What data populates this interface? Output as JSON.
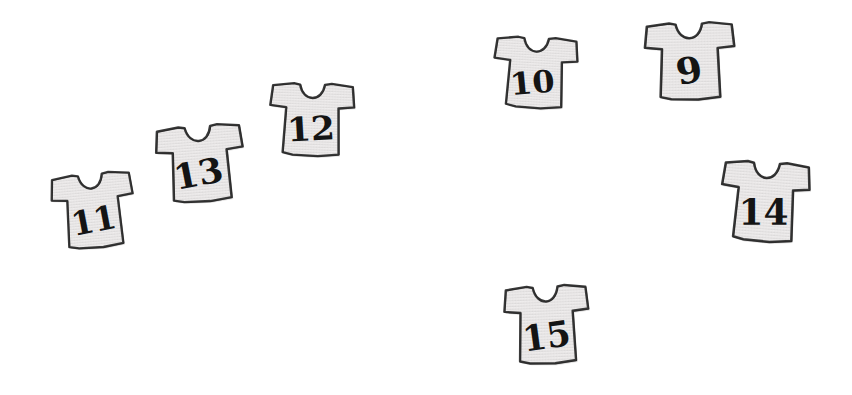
{
  "scene": {
    "width": 852,
    "height": 395,
    "background_color": "#ffffff",
    "description": "Seven hand-drawn t-shirt sketches each labelled with a number"
  },
  "style": {
    "shirt_fill": "#eceaea",
    "shirt_fill_shadow": "#dbd9d9",
    "shirt_outline": "#3a3a3a",
    "number_color": "#141414"
  },
  "shirts": [
    {
      "id": "shirt-11",
      "number": "11",
      "x": 48,
      "y": 168,
      "width": 90,
      "height": 84,
      "rotation": -5,
      "number_size": 36,
      "number_dx": 0,
      "number_dy": 10,
      "number_skew": -6
    },
    {
      "id": "shirt-13",
      "number": "13",
      "x": 152,
      "y": 120,
      "width": 96,
      "height": 86,
      "rotation": -4,
      "number_size": 37,
      "number_dx": -2,
      "number_dy": 10,
      "number_skew": -7
    },
    {
      "id": "shirt-12",
      "number": "12",
      "x": 265,
      "y": 78,
      "width": 93,
      "height": 82,
      "rotation": 2,
      "number_size": 37,
      "number_dx": 0,
      "number_dy": 10,
      "number_skew": -5
    },
    {
      "id": "shirt-10",
      "number": "10",
      "x": 489,
      "y": 32,
      "width": 92,
      "height": 80,
      "rotation": 3,
      "number_size": 35,
      "number_dx": -2,
      "number_dy": 11,
      "number_skew": -8
    },
    {
      "id": "shirt-9",
      "number": "9",
      "x": 640,
      "y": 17,
      "width": 99,
      "height": 87,
      "rotation": -1,
      "number_size": 38,
      "number_dx": 0,
      "number_dy": 10,
      "number_skew": -9
    },
    {
      "id": "shirt-14",
      "number": "14",
      "x": 716,
      "y": 156,
      "width": 97,
      "height": 90,
      "rotation": 4,
      "number_size": 37,
      "number_dx": 0,
      "number_dy": 11,
      "number_skew": -4
    },
    {
      "id": "shirt-15",
      "number": "15",
      "x": 500,
      "y": 280,
      "width": 93,
      "height": 88,
      "rotation": -2,
      "number_size": 37,
      "number_dx": 0,
      "number_dy": 12,
      "number_skew": -6
    }
  ]
}
